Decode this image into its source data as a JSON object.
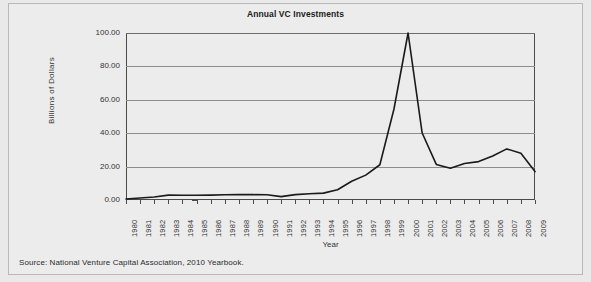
{
  "chart_data": {
    "type": "line",
    "title": "Annual VC Investments",
    "xlabel": "Year",
    "ylabel": "Billions of Dollars",
    "categories": [
      "1980",
      "1981",
      "1982",
      "1983",
      "1984",
      "1985",
      "1986",
      "1987",
      "1988",
      "1989",
      "1990",
      "1991",
      "1992",
      "1993",
      "1994",
      "1995",
      "1996",
      "1997",
      "1998",
      "1999",
      "2000",
      "2001",
      "2002",
      "2003",
      "2004",
      "2005",
      "2006",
      "2007",
      "2008",
      "2009"
    ],
    "values": [
      0.6,
      1.2,
      1.8,
      2.9,
      2.8,
      2.8,
      2.9,
      3.1,
      3.2,
      3.2,
      3.1,
      2.0,
      3.2,
      3.7,
      4.1,
      6.1,
      11.2,
      14.9,
      21.1,
      54.5,
      100.0,
      40.1,
      21.3,
      19.0,
      21.9,
      23.0,
      26.4,
      30.6,
      28.0,
      17.0
    ],
    "unit": "Billions of Dollars",
    "ylim": [
      0,
      100
    ],
    "yticks": [
      0,
      20,
      40,
      60,
      80,
      100
    ],
    "ytick_labels": [
      "0.00",
      "20.00",
      "40.00",
      "60.00",
      "80.00",
      "100.00"
    ],
    "grid": true,
    "legend": false,
    "line_color": "#1a1a1a",
    "grid_color": "#8d8d8d",
    "plot_background": "#ececec",
    "figure_background": "#e9e9e9"
  },
  "source": {
    "note": "Source: National Venture Capital Association, 2010 Yearbook."
  }
}
